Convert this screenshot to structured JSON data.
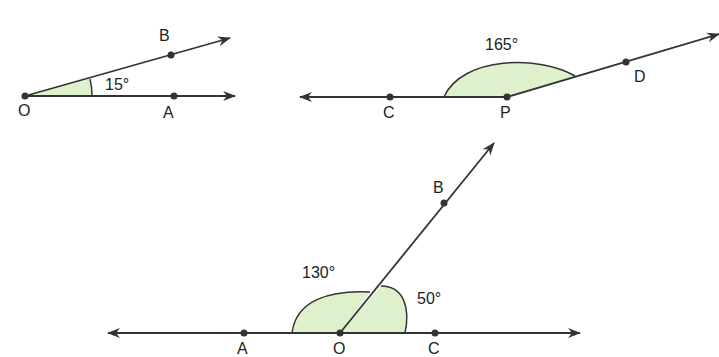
{
  "colors": {
    "line": "#333333",
    "fill": "#dff0cc",
    "text": "#222222"
  },
  "figure1": {
    "angle_label": "15°",
    "points": {
      "O": "O",
      "A": "A",
      "B": "B"
    }
  },
  "figure2": {
    "angle_label": "165°",
    "points": {
      "C": "C",
      "P": "P",
      "D": "D"
    }
  },
  "figure3": {
    "angle_label_left": "130°",
    "angle_label_right": "50°",
    "points": {
      "A": "A",
      "O": "O",
      "C": "C",
      "B": "B"
    }
  }
}
